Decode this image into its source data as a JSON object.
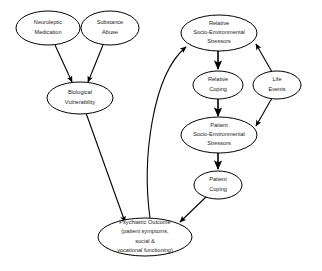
{
  "diagram": {
    "background_color": "#ffffff",
    "stroke_color": "#000000",
    "text_color": "#1a1a1a",
    "nodes": [
      {
        "id": "neuroleptic-medication",
        "lines": [
          "Neuroleptic",
          "Medication"
        ],
        "cx": 48,
        "cy": 28,
        "rx": 32,
        "ry": 17,
        "font_size": 5.6
      },
      {
        "id": "substance-abuse",
        "lines": [
          "Substance",
          "Abuse"
        ],
        "cx": 110,
        "cy": 28,
        "rx": 29,
        "ry": 17,
        "font_size": 5.6
      },
      {
        "id": "biological-vulnerability",
        "lines": [
          "Biological",
          "Vulnerability"
        ],
        "cx": 80,
        "cy": 98,
        "rx": 33,
        "ry": 16,
        "font_size": 5.6
      },
      {
        "id": "relative-socio-environmental-stressors",
        "lines": [
          "Relative",
          "Socio-Environmental",
          "Stressors"
        ],
        "cx": 219,
        "cy": 33,
        "rx": 38,
        "ry": 18,
        "font_size": 5.6
      },
      {
        "id": "relative-coping",
        "lines": [
          "Relative",
          "Coping"
        ],
        "cx": 218,
        "cy": 85,
        "rx": 25,
        "ry": 14,
        "font_size": 5.6
      },
      {
        "id": "life-events",
        "lines": [
          "Life",
          "Events"
        ],
        "cx": 277,
        "cy": 85,
        "rx": 24,
        "ry": 14,
        "font_size": 5.6
      },
      {
        "id": "patient-socio-environmental-stressors",
        "lines": [
          "Patient",
          "Socio-Environmental",
          "Stressors"
        ],
        "cx": 219,
        "cy": 135,
        "rx": 38,
        "ry": 18,
        "font_size": 5.6
      },
      {
        "id": "patient-coping",
        "lines": [
          "Patient",
          "Coping"
        ],
        "cx": 218,
        "cy": 185,
        "rx": 24,
        "ry": 14,
        "font_size": 5.6
      },
      {
        "id": "psychiatric-outcome",
        "lines": [
          "Psychiatric Outcome",
          "(patient symptoms,",
          "social &",
          "vocational functioning)"
        ],
        "cx": 145,
        "cy": 237,
        "rx": 47,
        "ry": 19,
        "font_size": 5.6
      }
    ],
    "edges": [
      {
        "id": "edge-neuroleptic-to-biological",
        "from": "neuroleptic-medication",
        "to": "biological-vulnerability",
        "kind": "straight",
        "path": "M 55 45 L 72 82",
        "arrow": true
      },
      {
        "id": "edge-substance-to-biological",
        "from": "substance-abuse",
        "to": "biological-vulnerability",
        "kind": "straight",
        "path": "M 103 45 L 88 82",
        "arrow": true
      },
      {
        "id": "edge-biological-to-outcome",
        "from": "biological-vulnerability",
        "to": "psychiatric-outcome",
        "kind": "straight",
        "path": "M 86 113 L 125 222",
        "arrow": true
      },
      {
        "id": "edge-relative-stressors-to-relative-coping",
        "from": "relative-socio-environmental-stressors",
        "to": "relative-coping",
        "kind": "straight",
        "path": "M 218 51 L 218 69",
        "arrow": true,
        "thick": true
      },
      {
        "id": "edge-relative-coping-to-patient-stressors",
        "from": "relative-coping",
        "to": "patient-socio-environmental-stressors",
        "kind": "straight",
        "path": "M 218 99 L 218 116",
        "arrow": true,
        "thick": true
      },
      {
        "id": "edge-patient-stressors-to-patient-coping",
        "from": "patient-socio-environmental-stressors",
        "to": "patient-coping",
        "kind": "straight",
        "path": "M 218 153 L 218 169",
        "arrow": true,
        "thick": true
      },
      {
        "id": "edge-life-events-to-relative-stressors",
        "from": "life-events",
        "to": "relative-socio-environmental-stressors",
        "kind": "straight",
        "path": "M 272 72 L 256 44",
        "arrow": true
      },
      {
        "id": "edge-life-events-to-patient-stressors",
        "from": "life-events",
        "to": "patient-socio-environmental-stressors",
        "kind": "straight",
        "path": "M 272 98 L 256 126",
        "arrow": true
      },
      {
        "id": "edge-patient-coping-to-outcome",
        "from": "patient-coping",
        "to": "psychiatric-outcome",
        "kind": "straight",
        "path": "M 207 196 L 180 222",
        "arrow": true
      },
      {
        "id": "edge-outcome-to-relative-stressors",
        "from": "psychiatric-outcome",
        "to": "relative-socio-environmental-stressors",
        "kind": "curved",
        "path": "M 150 218 C 142 160 152 75 186 47",
        "arrow": true
      }
    ]
  }
}
